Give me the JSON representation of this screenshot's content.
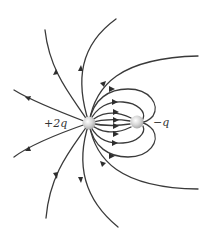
{
  "diagram": {
    "type": "electric-field-lines",
    "charges": [
      {
        "label": "+2q",
        "sign": "positive",
        "cx": 89,
        "cy": 123,
        "r": 6.5
      },
      {
        "label": "−q",
        "sign": "negative",
        "cx": 137,
        "cy": 122,
        "r": 6.5
      }
    ],
    "colors": {
      "line": "#3a3a3a",
      "arrow": "#2e2e2e",
      "charge_fill": "#d8d8d8",
      "charge_highlight": "#ffffff",
      "background": "#ffffff"
    }
  }
}
